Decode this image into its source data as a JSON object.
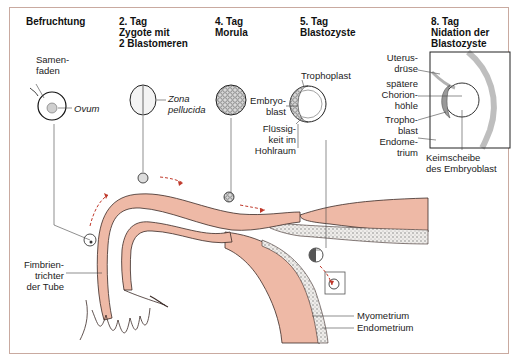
{
  "stages": [
    {
      "title_lines": [
        "Befruchtung"
      ]
    },
    {
      "title_lines": [
        "2. Tag",
        "Zygote mit",
        "2 Blastomeren"
      ]
    },
    {
      "title_lines": [
        "4.  Tag",
        "Morula"
      ]
    },
    {
      "title_lines": [
        "5. Tag",
        "Blastozyste"
      ]
    },
    {
      "title_lines": [
        "8. Tag",
        "Nidation der",
        "Blastozyste"
      ]
    }
  ],
  "labels": {
    "samenfaden": [
      "Samen-",
      "faden"
    ],
    "ovum": "Ovum",
    "zona_pellucida": [
      "Zona",
      "pellucida"
    ],
    "trophoplast": "Trophoplast",
    "embryoblast": [
      "Embryo-",
      "blast"
    ],
    "fluessigkeit": [
      "Flüssig-",
      "keit im",
      "Hohlraum"
    ],
    "uterusdruese": [
      "Uterus-",
      "drüse"
    ],
    "chorionhoehle": [
      "spätere",
      "Chorion-",
      "höhle"
    ],
    "trophoblast": [
      "Tropho-",
      "blast"
    ],
    "endometrium_inset": [
      "Endome-",
      "trium"
    ],
    "keimscheibe": [
      "Keimscheibe",
      "des Embryoblast"
    ],
    "fimbrientrichter": [
      "Fimbrien-",
      "trichter",
      "der Tube"
    ],
    "myometrium": "Myometrium",
    "endometrium": "Endometrium"
  },
  "colors": {
    "tissue": "#eeb9a6",
    "tissue_outline": "#3a2a26",
    "arrow": "#c0392b",
    "frame": "#c9aaa0",
    "endometrium_fill": "#e8e6e2"
  }
}
